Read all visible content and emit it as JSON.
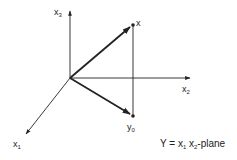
{
  "diagram": {
    "type": "3d-coordinate-projection",
    "colors": {
      "ink": "#222222",
      "background": "#ffffff"
    },
    "axes": [
      {
        "id": "x1",
        "label": "x",
        "subscript": "1"
      },
      {
        "id": "x2",
        "label": "x",
        "subscript": "2"
      },
      {
        "id": "x3",
        "label": "x",
        "subscript": "3"
      }
    ],
    "points": [
      {
        "id": "x",
        "label": "x"
      },
      {
        "id": "y0",
        "label": "y",
        "subscript": "0"
      }
    ],
    "caption": {
      "prefix": "Y = x",
      "sub1": "1",
      "mid": " x",
      "sub2": "2",
      "suffix": "-plane"
    }
  }
}
